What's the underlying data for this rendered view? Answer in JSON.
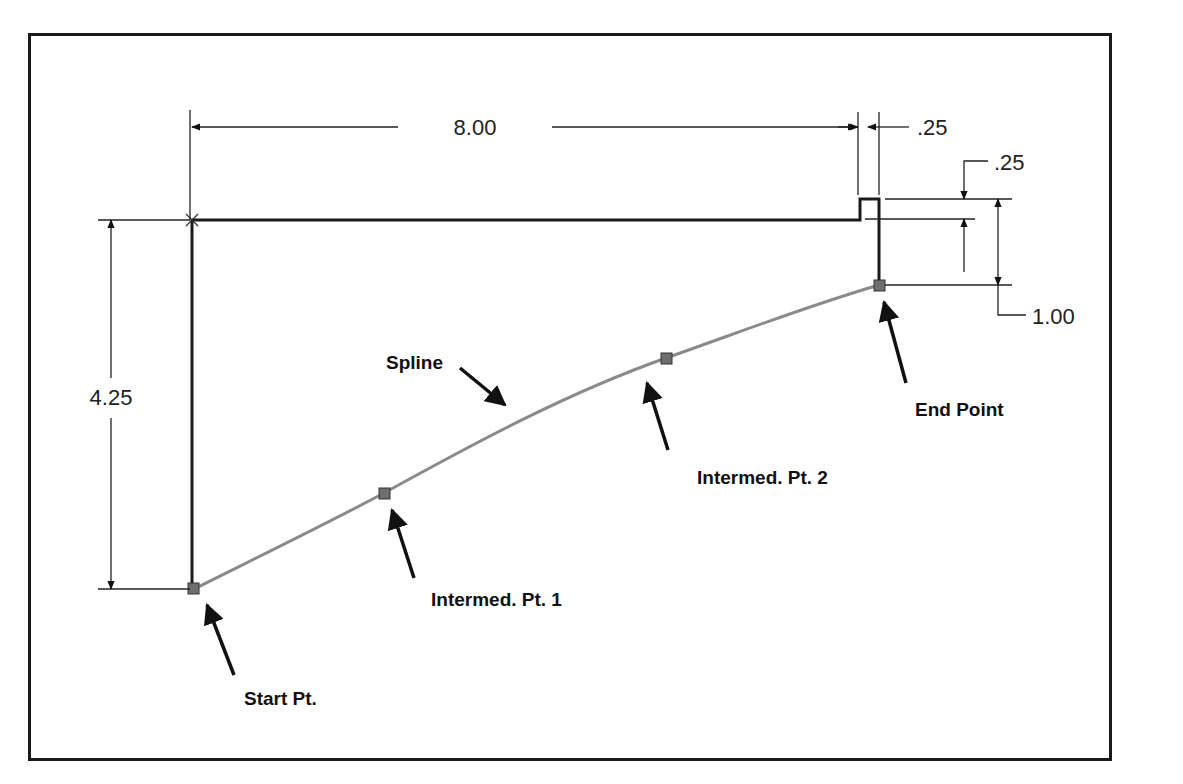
{
  "figure": {
    "type": "sketch-dimension-diagram",
    "dimensions": {
      "horizontal_main": "8.00",
      "horizontal_step": ".25",
      "vertical_step": ".25",
      "vertical_drop": "1.00",
      "vertical_left": "4.25"
    },
    "callouts": {
      "spline": "Spline",
      "start_point": "Start Pt.",
      "intermediate_1": "Intermed. Pt. 1",
      "intermediate_2": "Intermed. Pt. 2",
      "end_point": "End Point"
    },
    "colors": {
      "outline": "#1a1a1a",
      "spline": "#8a8a8a",
      "point_fill": "#6e6e6e",
      "text": "#111111"
    }
  }
}
